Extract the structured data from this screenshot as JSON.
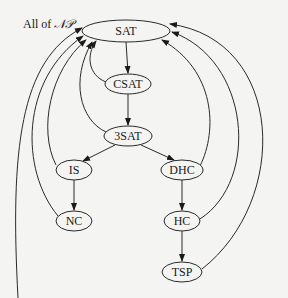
{
  "diagram": {
    "title_label": {
      "prefix": "All of ",
      "script": "𝒩𝒫"
    },
    "colors": {
      "background": "#f4f4f2",
      "stroke": "#2a2a2a",
      "text": "#1a1a1a"
    },
    "nodes": [
      {
        "id": "SAT",
        "label": "SAT",
        "cx": 126,
        "cy": 31,
        "rx": 44,
        "ry": 11
      },
      {
        "id": "CSAT",
        "label": "CSAT",
        "cx": 128,
        "cy": 84,
        "rx": 23,
        "ry": 10
      },
      {
        "id": "3SAT",
        "label": "3SAT",
        "cx": 128,
        "cy": 136,
        "rx": 24,
        "ry": 10
      },
      {
        "id": "IS",
        "label": "IS",
        "cx": 74,
        "cy": 170,
        "rx": 18,
        "ry": 10
      },
      {
        "id": "DHC",
        "label": "DHC",
        "cx": 182,
        "cy": 170,
        "rx": 21,
        "ry": 10
      },
      {
        "id": "NC",
        "label": "NC",
        "cx": 74,
        "cy": 221,
        "rx": 18,
        "ry": 10
      },
      {
        "id": "HC",
        "label": "HC",
        "cx": 182,
        "cy": 221,
        "rx": 18,
        "ry": 10
      },
      {
        "id": "TSP",
        "label": "TSP",
        "cx": 182,
        "cy": 272,
        "rx": 20,
        "ry": 10
      }
    ],
    "edges": [
      {
        "from": "SAT",
        "to": "CSAT"
      },
      {
        "from": "CSAT",
        "to": "3SAT"
      },
      {
        "from": "3SAT",
        "to": "IS"
      },
      {
        "from": "3SAT",
        "to": "DHC"
      },
      {
        "from": "IS",
        "to": "NC"
      },
      {
        "from": "DHC",
        "to": "HC"
      },
      {
        "from": "HC",
        "to": "TSP"
      },
      {
        "from": "CSAT",
        "to": "SAT",
        "curved": true
      },
      {
        "from": "3SAT",
        "to": "SAT",
        "curved": true
      },
      {
        "from": "IS",
        "to": "SAT",
        "curved": true
      },
      {
        "from": "NC",
        "to": "SAT",
        "curved": true
      },
      {
        "from": "DHC",
        "to": "SAT",
        "curved": true
      },
      {
        "from": "HC",
        "to": "SAT",
        "curved": true
      },
      {
        "from": "TSP",
        "to": "SAT",
        "curved": true
      },
      {
        "from": "All of NP",
        "to": "SAT",
        "curved": true
      }
    ]
  }
}
